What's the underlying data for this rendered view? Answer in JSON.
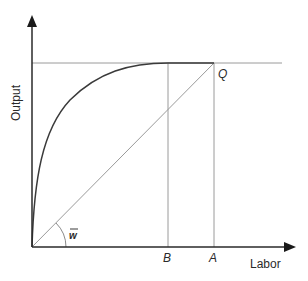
{
  "diagram": {
    "axes": {
      "y_label": "Output",
      "x_label": "Labor"
    },
    "points": {
      "Q": "Q",
      "A": "A",
      "B": "B"
    },
    "angle_label": "w",
    "colors": {
      "axis": "#2a2a2a",
      "curve": "#3a3a3a",
      "guide": "#9a9a9a",
      "background": "#ffffff"
    },
    "elements": [
      "production curve (concave, rising from origin to plateau at maximum output)",
      "horizontal line at maximum output level",
      "ray from origin to point Q with slope w-bar",
      "vertical line at B where the curve reaches maximum",
      "vertical line at A through Q"
    ]
  }
}
